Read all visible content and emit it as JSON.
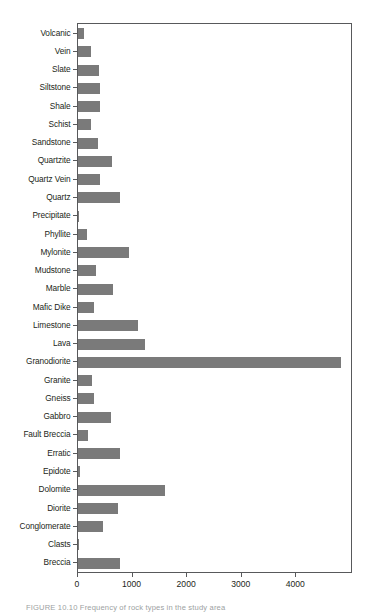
{
  "figure": {
    "caption": "FIGURE 10.10   Frequency of rock types in the study area"
  },
  "chart_data": {
    "type": "bar",
    "orientation": "horizontal",
    "title": "",
    "xlabel": "",
    "ylabel": "",
    "xlim": [
      0,
      5020
    ],
    "grid": false,
    "legend": null,
    "bar_color": "#7a7a7a",
    "frame_color": "#58595b",
    "xticks": [
      0,
      1000,
      2000,
      3000,
      4000
    ],
    "xtick_labels": [
      "0",
      "1000",
      "2000",
      "3000",
      "4000"
    ],
    "categories": [
      "Volcanic",
      "Vein",
      "Slate",
      "Siltstone",
      "Shale",
      "Schist",
      "Sandstone",
      "Quartzite",
      "Quartz Vein",
      "Quartz",
      "Precipitate",
      "Phyllite",
      "Mylonite",
      "Mudstone",
      "Marble",
      "Mafic Dike",
      "Limestone",
      "Lava",
      "Granodiorite",
      "Granite",
      "Gneiss",
      "Gabbro",
      "Fault Breccia",
      "Erratic",
      "Epidote",
      "Dolomite",
      "Diorite",
      "Conglomerate",
      "Clasts",
      "Breccia"
    ],
    "values": [
      110,
      230,
      390,
      400,
      395,
      240,
      370,
      630,
      400,
      770,
      20,
      160,
      940,
      330,
      640,
      290,
      1095,
      1220,
      4810,
      250,
      300,
      600,
      190,
      770,
      30,
      1590,
      740,
      450,
      10,
      770
    ]
  }
}
